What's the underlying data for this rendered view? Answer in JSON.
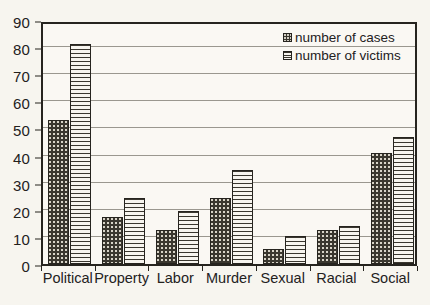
{
  "chart_data": {
    "type": "bar",
    "title": "",
    "subtitle": "",
    "xlabel": "",
    "ylabel": "",
    "ylim": [
      0,
      90
    ],
    "ytick_step": 10,
    "yticks": [
      0,
      10,
      20,
      30,
      40,
      50,
      60,
      70,
      80,
      90
    ],
    "ytick_labels": [
      "0",
      "10",
      "20",
      "30",
      "40",
      "50",
      "60",
      "70",
      "80",
      "90"
    ],
    "grid": true,
    "grid_axis": "y",
    "legend_position": "top-right",
    "categories": [
      "Political",
      "Property",
      "Labor",
      "Murder",
      "Sexual",
      "Racial",
      "Social"
    ],
    "series": [
      {
        "name": "number of cases",
        "pattern": "dotted-dark",
        "color": "#3a372f",
        "values": [
          53,
          17.5,
          12.5,
          24.5,
          5.5,
          12.5,
          41
        ]
      },
      {
        "name": "number of victims",
        "pattern": "horizontal-stripes",
        "color": "#f7f5ef",
        "values": [
          81,
          24.5,
          19.5,
          34.5,
          10.5,
          14,
          47
        ]
      }
    ],
    "annotations": []
  },
  "legend": {
    "items": [
      {
        "label": "number of cases",
        "swatch": "dotted-swatch-icon"
      },
      {
        "label": "number of victims",
        "swatch": "striped-swatch-icon"
      }
    ]
  },
  "colors": {
    "background": "#f7f5ef",
    "plot_background": "#faf8f3",
    "axis": "#26241f",
    "gridline": "#9a978f",
    "text": "#23211d",
    "series_cases": "#3a372f",
    "series_victims": "#f7f5ef"
  }
}
